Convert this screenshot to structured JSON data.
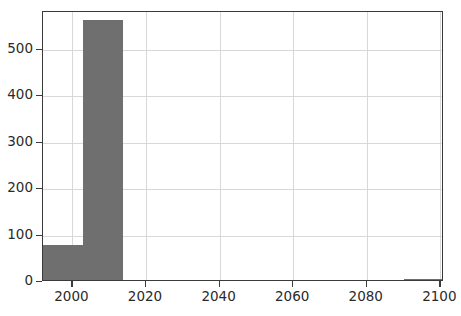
{
  "chart_data": {
    "type": "bar",
    "title": "",
    "xlabel": "",
    "ylabel": "",
    "xlim": [
      1992,
      2101
    ],
    "ylim": [
      0,
      581
    ],
    "grid": true,
    "legend": null,
    "bar_color": "#6f6f6f",
    "bin_edges": [
      1992,
      2002.9,
      2013.8,
      2024.7,
      2035.6,
      2046.5,
      2057.4,
      2068.3,
      2079.2,
      2090.1,
      2101
    ],
    "categories": [
      "1992-2003",
      "2003-2014",
      "2014-2025",
      "2025-2036",
      "2036-2046",
      "2046-2057",
      "2057-2068",
      "2068-2079",
      "2079-2090",
      "2090-2101"
    ],
    "values": [
      75,
      560,
      0,
      0,
      0,
      0,
      0,
      0,
      0,
      3
    ],
    "y_ticks": [
      0,
      100,
      200,
      300,
      400,
      500
    ],
    "y_tick_labels": [
      "0",
      "100",
      "200",
      "300",
      "400",
      "500"
    ],
    "x_ticks": [
      2000,
      2020,
      2040,
      2060,
      2080,
      2100
    ],
    "x_tick_labels": [
      "2000",
      "2020",
      "2040",
      "2060",
      "2080",
      "2100"
    ]
  }
}
